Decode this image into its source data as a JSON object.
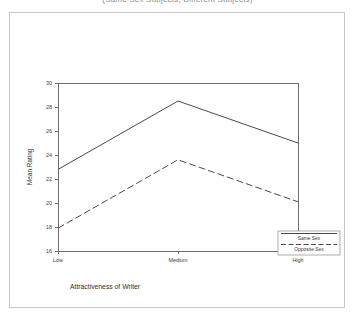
{
  "title": {
    "text": "(Same Sex Subjects, Different Subjects)",
    "visible_note": "cut-off at top edge"
  },
  "axis_titles": {
    "x": "Attractiveness of Writer",
    "y": "Mean Rating"
  },
  "legend": {
    "entries": [
      {
        "label": "Same Sex",
        "style": "solid"
      },
      {
        "label": "Opposite Sex",
        "style": "dashed"
      }
    ]
  },
  "chart_data": {
    "type": "line",
    "title": "(Same Sex Subjects, Different Subjects)",
    "xlabel": "Attractiveness of Writer",
    "ylabel": "Mean Rating",
    "categories": [
      "Low",
      "Medium",
      "High"
    ],
    "ylim": [
      16,
      30
    ],
    "yticks": [
      16,
      18,
      20,
      22,
      24,
      26,
      28,
      30
    ],
    "grid": false,
    "legend_position": "right-bottom",
    "series": [
      {
        "name": "Same Sex",
        "style": "solid",
        "values": [
          22.8,
          28.5,
          25.0
        ]
      },
      {
        "name": "Opposite Sex",
        "style": "dashed",
        "values": [
          17.9,
          23.6,
          20.1
        ]
      }
    ]
  }
}
